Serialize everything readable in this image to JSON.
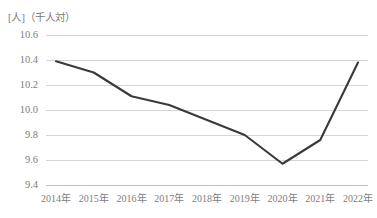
{
  "chart_data": {
    "type": "line",
    "title": "",
    "subtitle": "",
    "xlabel": "",
    "ylabel": "[人]（千人対）",
    "y_unit_caption": "[人]（千人対）",
    "categories": [
      "2014年",
      "2015年",
      "2016年",
      "2017年",
      "2018年",
      "2019年",
      "2020年",
      "2021年",
      "2022年"
    ],
    "values": [
      10.39,
      10.3,
      10.11,
      10.04,
      9.92,
      9.8,
      9.57,
      9.76,
      10.38
    ],
    "series": [
      {
        "name": "",
        "values": [
          10.39,
          10.3,
          10.11,
          10.04,
          9.92,
          9.8,
          9.57,
          9.76,
          10.38
        ]
      }
    ],
    "ylim": [
      9.4,
      10.6
    ],
    "ytick_labels": [
      "10.6",
      "10.4",
      "10.2",
      "10.0",
      "9.8",
      "9.6",
      "9.4"
    ],
    "ytick_values": [
      10.6,
      10.4,
      10.2,
      10.0,
      9.8,
      9.6,
      9.4
    ],
    "grid": true,
    "grid_axis": "y",
    "legend": false,
    "legend_position": "none",
    "markers": false,
    "line_color": "#3a3a3a",
    "grid_color": "#d6d6d6",
    "text_color": "#7d7d7d",
    "background_color": "#ffffff",
    "annotations": []
  }
}
